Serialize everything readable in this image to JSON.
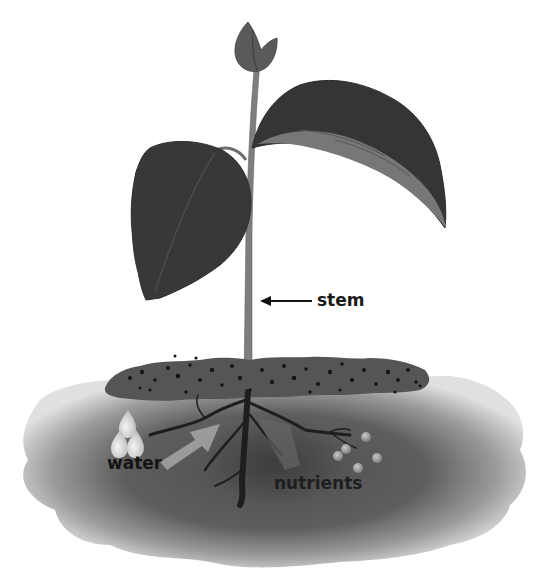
{
  "diagram": {
    "type": "plant-anatomy",
    "labels": {
      "stem": "stem",
      "water": "water",
      "nutrients": "nutrients"
    },
    "colors": {
      "leaf_dark": "#3a3a3a",
      "leaf_light": "#7a7a7a",
      "stem": "#7e7e7e",
      "soil_top": "#555555",
      "soil_body": "#5c5c5c",
      "soil_edge": "#d8d8d8",
      "roots": "#1e1e1e",
      "water_drop": "#e2e2e2",
      "arrow": "#9a9a9a",
      "nutrient_dot": "#9c9c9c",
      "label_text": "#1a1a1a"
    },
    "parts": [
      "bud",
      "left-leaf",
      "right-leaf",
      "stem",
      "soil-surface",
      "roots",
      "water-drops",
      "absorption-arrow",
      "nutrient-particles"
    ]
  }
}
